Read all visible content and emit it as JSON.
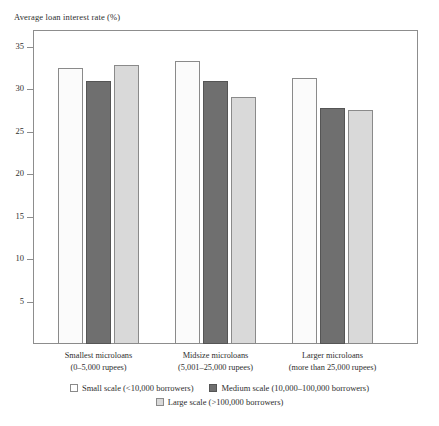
{
  "chart_data": {
    "type": "bar",
    "title": "Average loan interest rate (%)",
    "xlabel": "",
    "ylabel": "Average loan interest rate (%)",
    "ylim": [
      0,
      37
    ],
    "yticks": [
      5,
      10,
      15,
      20,
      25,
      30,
      35
    ],
    "grid": false,
    "legend_position": "bottom",
    "categories": [
      "Smallest microloans (0–5,000 rupees)",
      "Midsize microloans (5,001–25,000 rupees)",
      "Larger microloans (more than 25,000 rupees)"
    ],
    "category_lines": [
      {
        "line1": "Smallest microloans",
        "line2": "(0–5,000 rupees)"
      },
      {
        "line1": "Midsize microloans",
        "line2": "(5,001–25,000 rupees)"
      },
      {
        "line1": "Larger microloans",
        "line2": "(more than 25,000 rupees)"
      }
    ],
    "series": [
      {
        "name": "Small scale (<10,000 borrowers)",
        "key": "small",
        "color": "#fbfbfb",
        "values": [
          32.5,
          33.4,
          31.4
        ]
      },
      {
        "name": "Medium scale (10,000–100,000 borrowers)",
        "key": "medium",
        "color": "#6f6f6f",
        "values": [
          31.0,
          31.0,
          27.8
        ]
      },
      {
        "name": "Large scale (>100,000 borrowers)",
        "key": "large",
        "color": "#d9d9d9",
        "values": [
          32.9,
          29.1,
          27.6
        ]
      }
    ]
  },
  "axis": {
    "title": "Average loan interest rate (%)",
    "tick_labels": [
      "35",
      "30",
      "25",
      "20",
      "15",
      "10",
      "5"
    ]
  },
  "legend": {
    "row1": [
      {
        "label": "Small scale (<10,000 borrowers)",
        "swatch": "small"
      },
      {
        "label": "Medium scale (10,000–100,000 borrowers)",
        "swatch": "medium"
      }
    ],
    "row2": [
      {
        "label": "Large scale (>100,000 borrowers)",
        "swatch": "large"
      }
    ]
  }
}
